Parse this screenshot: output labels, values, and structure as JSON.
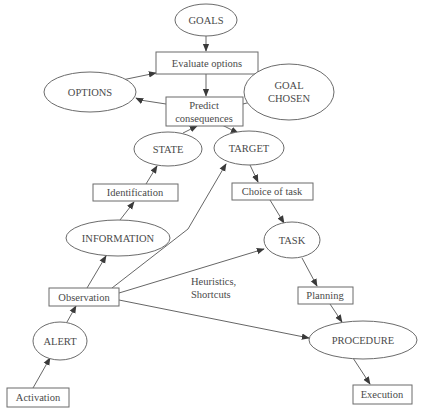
{
  "diagram": {
    "nodes": {
      "goals": {
        "label": "GOALS",
        "shape": "ellipse"
      },
      "evaluate_options": {
        "label": "Evaluate options",
        "shape": "rect"
      },
      "options": {
        "label": "OPTIONS",
        "shape": "ellipse"
      },
      "goal_chosen": {
        "line1": "GOAL",
        "line2": "CHOSEN",
        "shape": "ellipse"
      },
      "predict_consequences": {
        "line1": "Predict",
        "line2": "consequences",
        "shape": "rect"
      },
      "state": {
        "label": "STATE",
        "shape": "ellipse"
      },
      "target": {
        "label": "TARGET",
        "shape": "ellipse"
      },
      "identification": {
        "label": "Identification",
        "shape": "rect"
      },
      "choice_of_task": {
        "label": "Choice of task",
        "shape": "rect"
      },
      "information": {
        "label": "INFORMATION",
        "shape": "ellipse"
      },
      "task": {
        "label": "TASK",
        "shape": "ellipse"
      },
      "observation": {
        "label": "Observation",
        "shape": "rect"
      },
      "planning": {
        "label": "Planning",
        "shape": "rect"
      },
      "alert": {
        "label": "ALERT",
        "shape": "ellipse"
      },
      "procedure": {
        "label": "PROCEDURE",
        "shape": "ellipse"
      },
      "activation": {
        "label": "Activation",
        "shape": "rect"
      },
      "execution": {
        "label": "Execution",
        "shape": "rect"
      }
    },
    "annotations": {
      "shortcut_line1": "Heuristics,",
      "shortcut_line2": "Shortcuts"
    },
    "edges": [
      {
        "from": "Activation",
        "to": "ALERT"
      },
      {
        "from": "ALERT",
        "to": "Observation"
      },
      {
        "from": "Observation",
        "to": "INFORMATION"
      },
      {
        "from": "INFORMATION",
        "to": "Identification"
      },
      {
        "from": "Identification",
        "to": "STATE"
      },
      {
        "from": "STATE",
        "to": "Predict consequences"
      },
      {
        "from": "GOALS",
        "to": "Evaluate options"
      },
      {
        "from": "OPTIONS",
        "to": "Evaluate options"
      },
      {
        "from": "GOAL CHOSEN",
        "to": "Evaluate options"
      },
      {
        "from": "Evaluate options",
        "to": "Predict consequences"
      },
      {
        "from": "Predict consequences",
        "to": "OPTIONS"
      },
      {
        "from": "Predict consequences",
        "to": "GOAL CHOSEN"
      },
      {
        "from": "Predict consequences",
        "to": "TARGET"
      },
      {
        "from": "Observation",
        "to": "TARGET"
      },
      {
        "from": "TARGET",
        "to": "Choice of task"
      },
      {
        "from": "Choice of task",
        "to": "TASK"
      },
      {
        "from": "Observation",
        "to": "TASK",
        "label": "Heuristics, Shortcuts"
      },
      {
        "from": "TASK",
        "to": "Planning"
      },
      {
        "from": "Planning",
        "to": "PROCEDURE"
      },
      {
        "from": "Observation",
        "to": "PROCEDURE"
      },
      {
        "from": "PROCEDURE",
        "to": "Execution"
      }
    ],
    "colors": {
      "stroke": "#6b6b6b",
      "text": "#4a4a4a",
      "background": "#ffffff"
    }
  }
}
